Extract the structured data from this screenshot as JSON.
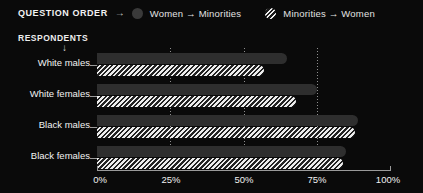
{
  "legend": {
    "title": "QUESTION ORDER",
    "arrow_glyph": "→",
    "items": [
      {
        "label": "Women → Minorities",
        "icon": "solid-circle-swatch",
        "style": "solid",
        "color": "#3a3a3a"
      },
      {
        "label": "Minorities → Women",
        "icon": "hatched-circle-swatch",
        "style": "hatch",
        "color": "#ededed"
      }
    ]
  },
  "respondents": {
    "caption": "RESPONDENTS",
    "arrow_glyph": "↓"
  },
  "chart_data": {
    "type": "bar",
    "orientation": "horizontal",
    "title": "",
    "xlabel": "",
    "ylabel": "RESPONDENTS",
    "categories": [
      "White males",
      "White females",
      "Black males",
      "Black females"
    ],
    "series": [
      {
        "name": "Women → Minorities",
        "style": "solid",
        "color": "#2e2e2e",
        "values": [
          65,
          75,
          89,
          85
        ]
      },
      {
        "name": "Minorities → Women",
        "style": "hatch",
        "color": "#ededed",
        "values": [
          57,
          68,
          88,
          84
        ]
      }
    ],
    "xlim": [
      0,
      100
    ],
    "xticks": [
      0,
      25,
      50,
      75,
      100
    ],
    "xtick_labels": [
      "0%",
      "25%",
      "50%",
      "75%",
      "100%"
    ],
    "grid": true,
    "grid_axis": "x",
    "legend_position": "top"
  },
  "background": "#0a0a0a",
  "text_color": "#f0f0f0"
}
